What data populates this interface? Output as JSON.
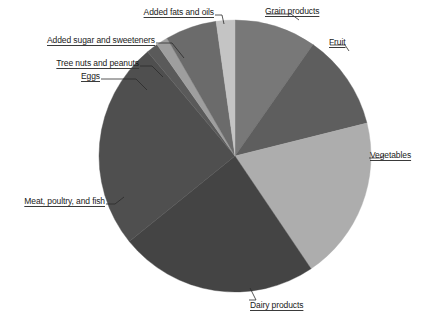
{
  "chart_data": {
    "type": "pie",
    "title": "",
    "subtitle": "",
    "xlabel": "",
    "ylabel": "",
    "legend_position": "none",
    "labels_position": "outside-with-leader-lines",
    "grid": false,
    "start_angle_deg": 0,
    "direction": "clockwise",
    "categories": [
      "Grain products",
      "Fruit",
      "Vegetables",
      "Dairy products",
      "Meat, poultry, and fish",
      "Eggs",
      "Tree nuts and peanuts",
      "Added sugar and sweeteners",
      "Added fats and oils"
    ],
    "values": [
      9.7,
      11.4,
      19.4,
      23.6,
      24.7,
      1.4,
      1.4,
      6.1,
      9.7
    ],
    "units": "percent",
    "slices": [
      {
        "label": "Grain products",
        "value": 9.7,
        "color": "#787878",
        "start_deg": 0.0,
        "end_deg": 35.0
      },
      {
        "label": "Fruit",
        "value": 11.4,
        "color": "#5e5e5e",
        "start_deg": 35.0,
        "end_deg": 76.0
      },
      {
        "label": "Vegetables",
        "value": 19.4,
        "color": "#adadad",
        "start_deg": 76.0,
        "end_deg": 146.0
      },
      {
        "label": "Dairy products",
        "value": 23.6,
        "color": "#444444",
        "start_deg": 146.0,
        "end_deg": 231.0
      },
      {
        "label": "Meat, poultry, and fish",
        "value": 24.7,
        "color": "#4f4f4f",
        "start_deg": 231.0,
        "end_deg": 320.0
      },
      {
        "label": "Eggs",
        "value": 1.4,
        "color": "#5a5a5a",
        "start_deg": 320.0,
        "end_deg": 325.0
      },
      {
        "label": "Tree nuts and peanuts",
        "value": 1.4,
        "color": "#9e9e9e",
        "start_deg": 325.0,
        "end_deg": 330.0
      },
      {
        "label": "Added sugar and sweeteners",
        "value": 6.1,
        "color": "#6b6b6b",
        "start_deg": 330.0,
        "end_deg": 352.0
      },
      {
        "label": "Added fats and oils",
        "value": 9.7,
        "color": "#c4c4c4",
        "start_deg": 352.0,
        "end_deg": 360.0
      }
    ]
  },
  "labels": {
    "grain_products": "Grain products",
    "fruit": "Fruit",
    "vegetables": "Vegetables",
    "dairy_products": "Dairy products",
    "meat_poultry_fish": "Meat, poultry, and fish",
    "eggs": "Eggs",
    "tree_nuts_peanuts": "Tree nuts and peanuts",
    "added_sugar_sweeteners": "Added sugar and sweeteners",
    "added_fats_oils": "Added fats and oils"
  },
  "colors": {
    "grain_products": "#787878",
    "fruit": "#5e5e5e",
    "vegetables": "#adadad",
    "dairy_products": "#444444",
    "meat_poultry_fish": "#4f4f4f",
    "eggs": "#5a5a5a",
    "tree_nuts_peanuts": "#9e9e9e",
    "added_sugar_sweeteners": "#6b6b6b",
    "added_fats_oils": "#c4c4c4",
    "leader_line": "#2b2b2b",
    "background": "#ffffff",
    "text": "#1a1a1a"
  }
}
